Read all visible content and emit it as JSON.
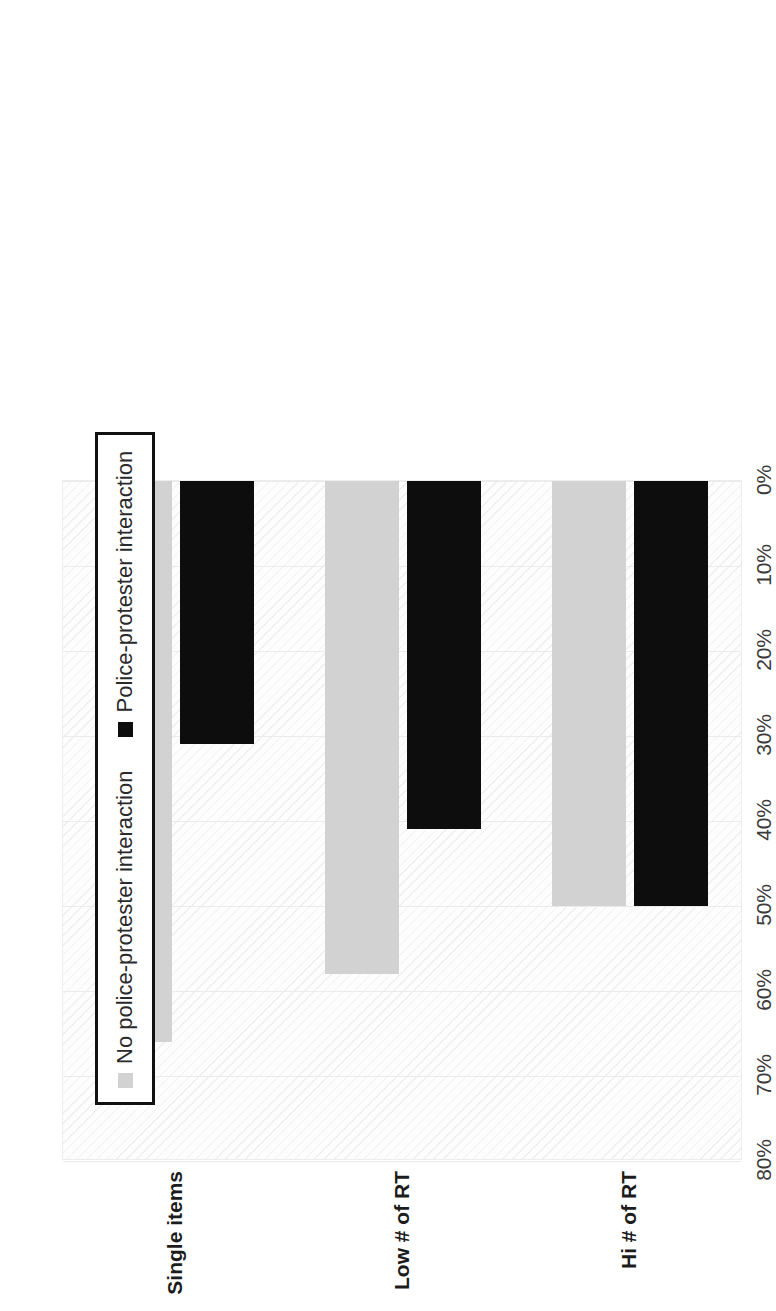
{
  "chart_data": {
    "type": "bar",
    "orientation": "horizontal",
    "title": "",
    "xlabel": "",
    "ylabel": "",
    "categories": [
      "Single items",
      "Low # of RT",
      "Hi # of RT"
    ],
    "series": [
      {
        "name": "No police-protester interaction",
        "color": "#d2d2d2",
        "values": [
          66,
          58,
          50
        ]
      },
      {
        "name": "Police-protester interaction",
        "color": "#0d0d0d",
        "values": [
          31,
          41,
          50
        ]
      }
    ],
    "axis": {
      "ticks": [
        "0%",
        "10%",
        "20%",
        "30%",
        "40%",
        "50%",
        "60%",
        "70%",
        "80%"
      ],
      "tick_values": [
        0,
        10,
        20,
        30,
        40,
        50,
        60,
        70,
        80
      ],
      "min": 0,
      "max": 80,
      "grid": true
    },
    "legend": {
      "position": "top-left",
      "bordered": true,
      "entries": [
        {
          "label": "No police-protester interaction",
          "color": "#d2d2d2"
        },
        {
          "label": "Police-protester interaction",
          "color": "#0d0d0d"
        }
      ]
    }
  }
}
